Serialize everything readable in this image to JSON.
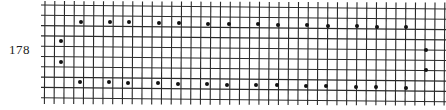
{
  "page": {
    "number": "178"
  },
  "chart_data": {
    "type": "scatter",
    "title": "",
    "grid": {
      "columns": 41,
      "rows": 9,
      "on": true,
      "line_color": "#2a2a2a",
      "origin_x": 45,
      "origin_y": 5,
      "cell_width": 9.75,
      "cell_height": 10.3,
      "slope_per_px": 0.01
    },
    "dot_color": "#111111",
    "dots": [
      {
        "x": 81,
        "y": 22
      },
      {
        "x": 110,
        "y": 22
      },
      {
        "x": 129,
        "y": 22
      },
      {
        "x": 159,
        "y": 23
      },
      {
        "x": 179,
        "y": 23
      },
      {
        "x": 208,
        "y": 24
      },
      {
        "x": 229,
        "y": 24
      },
      {
        "x": 258,
        "y": 24
      },
      {
        "x": 278,
        "y": 25
      },
      {
        "x": 307,
        "y": 25
      },
      {
        "x": 328,
        "y": 26
      },
      {
        "x": 357,
        "y": 26
      },
      {
        "x": 377,
        "y": 27
      },
      {
        "x": 406,
        "y": 27
      },
      {
        "x": 61,
        "y": 41
      },
      {
        "x": 61,
        "y": 62
      },
      {
        "x": 426,
        "y": 50
      },
      {
        "x": 426,
        "y": 70
      },
      {
        "x": 80,
        "y": 82
      },
      {
        "x": 109,
        "y": 82
      },
      {
        "x": 128,
        "y": 83
      },
      {
        "x": 158,
        "y": 83
      },
      {
        "x": 178,
        "y": 84
      },
      {
        "x": 207,
        "y": 84
      },
      {
        "x": 227,
        "y": 85
      },
      {
        "x": 256,
        "y": 85
      },
      {
        "x": 277,
        "y": 85
      },
      {
        "x": 306,
        "y": 86
      },
      {
        "x": 326,
        "y": 86
      },
      {
        "x": 356,
        "y": 87
      },
      {
        "x": 376,
        "y": 87
      },
      {
        "x": 406,
        "y": 88
      }
    ],
    "xlabel": "",
    "ylabel": "",
    "legend": []
  }
}
